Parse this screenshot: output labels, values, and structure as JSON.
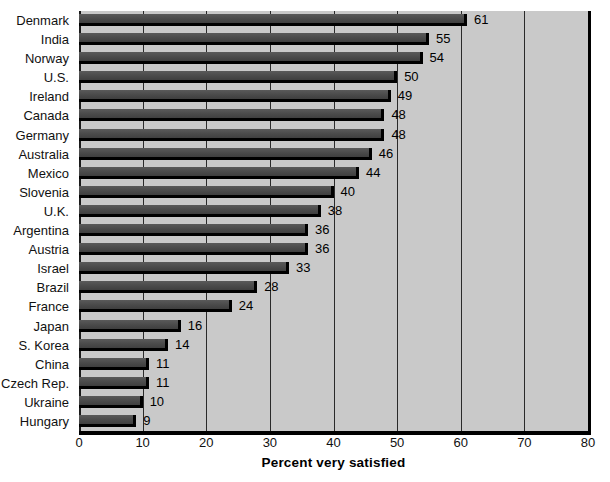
{
  "chart_data": {
    "type": "bar",
    "orientation": "horizontal",
    "title": "",
    "xlabel": "Percent very satisfied",
    "ylabel": "",
    "xlim": [
      0,
      80
    ],
    "xticks": [
      0,
      10,
      20,
      30,
      40,
      50,
      60,
      70,
      80
    ],
    "grid": true,
    "legend": "none",
    "categories": [
      "Denmark",
      "India",
      "Norway",
      "U.S.",
      "Ireland",
      "Canada",
      "Germany",
      "Australia",
      "Mexico",
      "Slovenia",
      "U.K.",
      "Argentina",
      "Austria",
      "Israel",
      "Brazil",
      "France",
      "Japan",
      "S. Korea",
      "China",
      "Czech Rep.",
      "Ukraine",
      "Hungary"
    ],
    "values": [
      61,
      55,
      54,
      50,
      49,
      48,
      48,
      46,
      44,
      40,
      38,
      36,
      36,
      33,
      28,
      24,
      16,
      14,
      11,
      11,
      10,
      9
    ],
    "value_labels": [
      "61",
      "55",
      "54",
      "50",
      "49",
      "48",
      "48",
      "46",
      "44",
      "40",
      "38",
      "36",
      "36",
      "33",
      "28",
      "24",
      "16",
      "14",
      "11",
      "11",
      "10",
      "9"
    ]
  },
  "style": {
    "plot_background": "#c9c9c9",
    "bar_color": "#4a4a4a",
    "bar_shadow": "#000000",
    "gridline_color": "#2a2a2a",
    "text_color": "#111111",
    "page_background": "#ffffff"
  }
}
